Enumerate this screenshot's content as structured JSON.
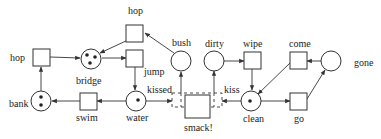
{
  "diagram": {
    "type": "petri-net",
    "places": [
      {
        "id": "bridge",
        "label": "bridge",
        "tokens": 3
      },
      {
        "id": "bush",
        "label": "bush",
        "tokens": 0
      },
      {
        "id": "bank",
        "label": "bank",
        "tokens": 2
      },
      {
        "id": "water",
        "label": "water",
        "tokens": 1
      },
      {
        "id": "dirty",
        "label": "dirty",
        "tokens": 0
      },
      {
        "id": "clean",
        "label": "clean",
        "tokens": 1
      },
      {
        "id": "gone",
        "label": "gone",
        "tokens": 0
      }
    ],
    "transitions": [
      {
        "id": "hop_left",
        "label": "hop"
      },
      {
        "id": "hop_top",
        "label": "hop"
      },
      {
        "id": "jump",
        "label": "jump"
      },
      {
        "id": "swim",
        "label": "swim"
      },
      {
        "id": "wipe",
        "label": "wipe"
      },
      {
        "id": "come",
        "label": "come"
      },
      {
        "id": "go",
        "label": "go"
      },
      {
        "id": "smack",
        "label": "smack!"
      }
    ],
    "arc_labels": {
      "kissed": "kissed",
      "kiss": "kiss"
    },
    "arcs": [
      [
        "bank",
        "hop_left"
      ],
      [
        "hop_left",
        "bridge"
      ],
      [
        "bridge",
        "jump"
      ],
      [
        "hop_top",
        "bridge"
      ],
      [
        "bush",
        "hop_top"
      ],
      [
        "jump",
        "water"
      ],
      [
        "water",
        "swim"
      ],
      [
        "swim",
        "bank"
      ],
      [
        "water",
        "smack"
      ],
      [
        "smack",
        "bush"
      ],
      [
        "clean",
        "smack"
      ],
      [
        "smack",
        "dirty"
      ],
      [
        "dirty",
        "wipe"
      ],
      [
        "wipe",
        "clean"
      ],
      [
        "clean",
        "go"
      ],
      [
        "go",
        "gone"
      ],
      [
        "gone",
        "come"
      ],
      [
        "come",
        "clean"
      ]
    ]
  }
}
